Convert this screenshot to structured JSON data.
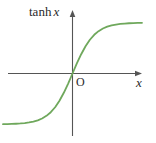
{
  "figure": {
    "kind": "math-plot",
    "width": 156,
    "height": 143,
    "background_color": "#ffffff"
  },
  "labels": {
    "y_axis_label_prefix": "tanh",
    "y_axis_label_variable": "x",
    "x_axis_label": "x",
    "origin_label": "O"
  },
  "colors": {
    "curve": "#6fa85c",
    "axis": "#555555",
    "text": "#2b2b2b"
  },
  "chart_data": {
    "type": "line",
    "xlabel": "x",
    "ylabel": "tanh x",
    "grid": false,
    "legend": null,
    "axes": {
      "origin_label": "O",
      "x_axis_arrow": true,
      "y_axis_arrow": true,
      "x_axis_range_px": [
        8,
        142
      ],
      "y_axis_range_px": [
        10,
        136
      ],
      "origin_px": [
        72,
        73
      ]
    },
    "xlim": [
      -3.2,
      3.2
    ],
    "ylim": [
      -1.25,
      1.25
    ],
    "asymptotes": [
      1,
      -1
    ],
    "series": [
      {
        "name": "tanh x",
        "color": "#6fa85c",
        "x": [
          -3.2,
          -3.0,
          -2.8,
          -2.6,
          -2.4,
          -2.2,
          -2.0,
          -1.8,
          -1.6,
          -1.4,
          -1.2,
          -1.0,
          -0.8,
          -0.6,
          -0.4,
          -0.2,
          0.0,
          0.2,
          0.4,
          0.6,
          0.8,
          1.0,
          1.2,
          1.4,
          1.6,
          1.8,
          2.0,
          2.2,
          2.4,
          2.6,
          2.8,
          3.0,
          3.2
        ],
        "y": [
          -0.9967,
          -0.9951,
          -0.9926,
          -0.989,
          -0.9837,
          -0.9757,
          -0.964,
          -0.9468,
          -0.9217,
          -0.8854,
          -0.8337,
          -0.7616,
          -0.664,
          -0.537,
          -0.3799,
          -0.1974,
          0.0,
          0.1974,
          0.3799,
          0.537,
          0.664,
          0.7616,
          0.8337,
          0.8854,
          0.9217,
          0.9468,
          0.964,
          0.9757,
          0.9837,
          0.989,
          0.9926,
          0.9951,
          0.9967
        ]
      }
    ]
  }
}
